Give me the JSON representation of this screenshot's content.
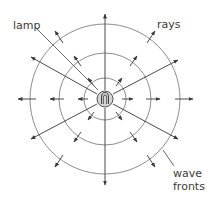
{
  "diagram": {
    "labels": {
      "lamp": "lamp",
      "rays": "rays",
      "wave_line1": "wave",
      "wave_line2": "fronts"
    },
    "colors": {
      "wavefront": "#8c8c8c",
      "ray": "#4a4a4a",
      "lamp_fill": "#d4d4d4",
      "text": "#3a3a3a"
    },
    "center": [
      105,
      99
    ],
    "wavefront_radii": [
      21,
      46,
      75
    ],
    "lamp_radius": 8
  }
}
